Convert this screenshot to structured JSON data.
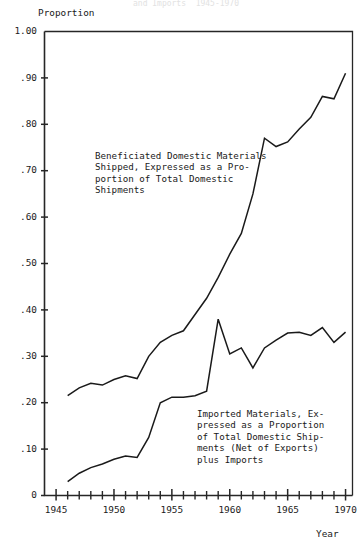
{
  "chart_data": {
    "type": "line",
    "title": "",
    "faint_header": "and Imports  1945-1970",
    "xlabel": "Year",
    "ylabel": "Proportion",
    "xlim": [
      1945,
      1970
    ],
    "ylim": [
      0,
      1.0
    ],
    "grid": false,
    "legend": "inline-annotations",
    "y_ticks": [
      "1.00",
      ".90",
      ".80",
      ".70",
      ".60",
      ".50",
      ".40",
      ".30",
      ".20",
      ".10",
      "0"
    ],
    "y_tick_values": [
      1.0,
      0.9,
      0.8,
      0.7,
      0.6,
      0.5,
      0.4,
      0.3,
      0.2,
      0.1,
      0.0
    ],
    "x_ticks": [
      "1945",
      "1950",
      "1955",
      "1960",
      "1965",
      "1970"
    ],
    "x_tick_values": [
      1945,
      1950,
      1955,
      1960,
      1965,
      1970
    ],
    "x_minor_step": 1,
    "x": [
      1946,
      1947,
      1948,
      1949,
      1950,
      1951,
      1952,
      1953,
      1954,
      1955,
      1956,
      1957,
      1958,
      1959,
      1960,
      1961,
      1962,
      1963,
      1964,
      1965,
      1966,
      1967,
      1968,
      1969,
      1970
    ],
    "series": [
      {
        "name": "Beneficiated Domestic Materials Shipped, Expressed as a Proportion of Total Domestic Shipments",
        "values": [
          0.215,
          0.232,
          0.242,
          0.238,
          0.25,
          0.258,
          0.252,
          0.3,
          0.33,
          0.345,
          0.355,
          0.39,
          0.425,
          0.47,
          0.52,
          0.565,
          0.65,
          0.77,
          0.752,
          0.762,
          0.79,
          0.815,
          0.86,
          0.855,
          0.91
        ],
        "annotation": {
          "lines": [
            "Beneficiated Domestic Materials",
            "Shipped, Expressed as a Pro-",
            "portion of Total Domestic",
            "Shipments"
          ]
        }
      },
      {
        "name": "Imported Materials, Expressed as a Proportion of Total Domestic Shipments (Net of Exports) plus Imports",
        "values": [
          0.03,
          0.048,
          0.06,
          0.068,
          0.078,
          0.085,
          0.082,
          0.125,
          0.2,
          0.212,
          0.212,
          0.215,
          0.225,
          0.38,
          0.305,
          0.318,
          0.275,
          0.318,
          0.335,
          0.35,
          0.352,
          0.345,
          0.362,
          0.33,
          0.352
        ],
        "annotation": {
          "lines": [
            "Imported Materials, Ex-",
            "pressed as a Proportion",
            "of Total Domestic Ship-",
            "ments (Net of Exports)",
            "plus Imports"
          ]
        }
      }
    ]
  }
}
